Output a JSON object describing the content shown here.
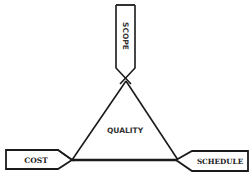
{
  "diagram": {
    "type": "project-management-triangle",
    "center_label": "QUALITY",
    "vertices": {
      "top": "SCOPE",
      "bottom_left": "COST",
      "bottom_right": "SCHEDULE"
    }
  },
  "colors": {
    "stroke": "#1a1a1a",
    "background": "#ffffff",
    "text": "#222222"
  }
}
